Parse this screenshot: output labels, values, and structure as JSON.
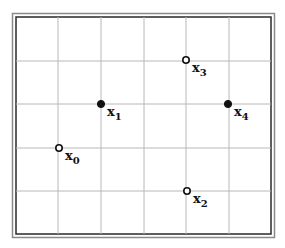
{
  "diagram": {
    "type": "point-grid",
    "frame": {
      "outer_color": "#8a8a8a",
      "inner_color": "#2a2a2a"
    },
    "grid": {
      "columns": 6,
      "rows": 5,
      "line_color": "#b8b8b8",
      "vertical_lines_x": [
        58,
        101,
        144,
        186,
        229
      ],
      "horizontal_lines_y": [
        61,
        104,
        148,
        191
      ]
    },
    "points": [
      {
        "id": "x0",
        "label": "x",
        "subscript": "0",
        "filled": false,
        "grid_col": 1,
        "grid_row": 3
      },
      {
        "id": "x1",
        "label": "x",
        "subscript": "1",
        "filled": true,
        "grid_col": 2,
        "grid_row": 2
      },
      {
        "id": "x2",
        "label": "x",
        "subscript": "2",
        "filled": false,
        "grid_col": 4,
        "grid_row": 4
      },
      {
        "id": "x3",
        "label": "x",
        "subscript": "3",
        "filled": false,
        "grid_col": 4,
        "grid_row": 1
      },
      {
        "id": "x4",
        "label": "x",
        "subscript": "4",
        "filled": true,
        "grid_col": 5,
        "grid_row": 2
      }
    ]
  }
}
